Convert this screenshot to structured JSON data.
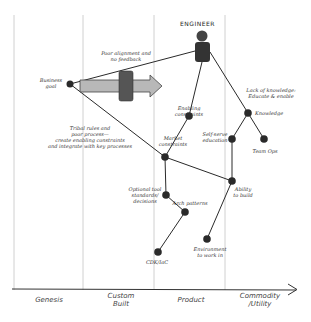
{
  "diagram": {
    "type": "wardley-map",
    "actor": {
      "label": "ENGINEER"
    },
    "axis": {
      "stages": [
        {
          "label": "Genesis"
        },
        {
          "label": "Custom\nBuilt"
        },
        {
          "label": "Product"
        },
        {
          "label": "Commodity\n/Utility"
        }
      ]
    },
    "nodes": [
      {
        "id": "business-goal",
        "label": "Business\ngoal"
      },
      {
        "id": "enabling-constraints",
        "label": "Enabling constraints"
      },
      {
        "id": "market-constraints",
        "label": "Market\nconstraints"
      },
      {
        "id": "knowledge",
        "label": "Knowledge"
      },
      {
        "id": "self-serve-education",
        "label": "Self-serve\neducation"
      },
      {
        "id": "team-ops",
        "label": "Team Ops"
      },
      {
        "id": "ability-to-build",
        "label": "Ability\nto build"
      },
      {
        "id": "optional-tool-standards",
        "label": "Optional tool\nstandards/\ndecisions"
      },
      {
        "id": "arch-patterns",
        "label": "Arch patterns"
      },
      {
        "id": "cdk-iac",
        "label": "CDK/IaC"
      },
      {
        "id": "environment",
        "label": "Environment\nto work in"
      }
    ],
    "annotations": [
      {
        "id": "poor-alignment",
        "text": "Poor alignment and\nno feedback"
      },
      {
        "id": "tribal-rules",
        "text": "Tribal rules and\npoor process—\ncreate enabling constraints\nand integrate with key processes"
      },
      {
        "id": "lack-knowledge",
        "text": "Lack of knowledge:\nEducate & enable"
      }
    ],
    "colors": {
      "node": "#2a2a2a",
      "line": "#2a2a2a",
      "grid": "#bbbbbb",
      "arrow_fill": "#b8b8b8",
      "blocker_fill": "#555555"
    }
  }
}
